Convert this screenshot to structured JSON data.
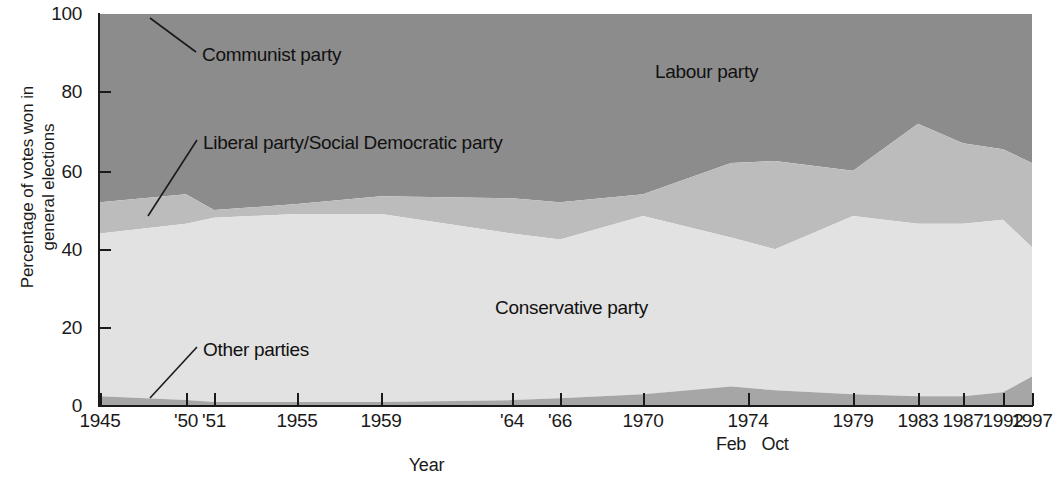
{
  "chart_data": {
    "type": "area",
    "stacked": true,
    "title": "",
    "xlabel": "Year",
    "ylabel": "Percentage of votes won in general elections",
    "ylim": [
      0,
      100
    ],
    "yticks": [
      0,
      20,
      40,
      60,
      80,
      100
    ],
    "grid": false,
    "legend_position": "in-plot-annotations",
    "categories": [
      "1945",
      "'50",
      "'51",
      "1955",
      "1959",
      "'64",
      "'66",
      "1970",
      "1974 Feb",
      "1974 Oct",
      "1979",
      "1983",
      "1987",
      "1992",
      "1997"
    ],
    "x_tick_labels": [
      "1945",
      "'50",
      "'51",
      "1955",
      "1959",
      "'64",
      "'66",
      "1970",
      "1974",
      "1979",
      "1983",
      "1987",
      "1992",
      "1997"
    ],
    "x_sub_tick_labels": [
      "Feb",
      "Oct"
    ],
    "series": [
      {
        "name": "Other parties",
        "color": "#a6a6a6",
        "values": [
          2.5,
          1.5,
          1.0,
          1.0,
          1.0,
          1.5,
          2.0,
          3.0,
          5.0,
          4.0,
          3.0,
          2.5,
          2.5,
          3.5,
          7.5
        ]
      },
      {
        "name": "Conservative party",
        "color": "#e2e2e2",
        "values": [
          41.5,
          45.0,
          47.0,
          48.0,
          48.0,
          42.5,
          40.5,
          45.5,
          38.0,
          36.0,
          45.5,
          44.0,
          44.0,
          44.0,
          33.0
        ]
      },
      {
        "name": "Liberal party/Social Democratic party",
        "color": "#bcbcbc",
        "values": [
          8.0,
          7.5,
          2.0,
          2.5,
          4.5,
          9.0,
          9.5,
          5.5,
          19.0,
          22.5,
          11.5,
          25.5,
          20.5,
          18.0,
          21.5
        ]
      },
      {
        "name": "Labour party",
        "color": "#8c8c8c",
        "values": [
          47.5,
          46.0,
          49.5,
          48.5,
          46.5,
          47.0,
          48.0,
          46.0,
          38.0,
          37.5,
          40.0,
          28.0,
          33.0,
          34.5,
          38.0
        ]
      },
      {
        "name": "Communist party",
        "color": "#8c8c8c",
        "values": [
          0.5,
          0.0,
          0.5,
          0.0,
          0.0,
          0.0,
          0.0,
          0.0,
          0.0,
          0.0,
          0.0,
          0.0,
          0.0,
          0.0,
          0.0
        ]
      }
    ],
    "stack_tops": {
      "other": [
        2.5,
        1.5,
        1.0,
        1.0,
        1.0,
        1.5,
        2.0,
        3.0,
        5.0,
        4.0,
        3.0,
        2.5,
        2.5,
        3.5,
        7.5
      ],
      "conservative": [
        44.0,
        46.5,
        48.0,
        49.0,
        49.0,
        44.0,
        42.5,
        48.5,
        43.0,
        40.0,
        48.5,
        46.5,
        46.5,
        47.5,
        40.5
      ],
      "liberal": [
        52.0,
        54.0,
        50.0,
        51.5,
        53.5,
        53.0,
        52.0,
        54.0,
        62.0,
        62.5,
        60.0,
        72.0,
        67.0,
        65.5,
        62.0
      ],
      "labour": [
        100,
        100,
        100,
        100,
        100,
        100,
        100,
        100,
        100,
        100,
        100,
        100,
        100,
        100,
        100
      ]
    },
    "annotations": [
      {
        "name": "Communist party",
        "text": "Communist party"
      },
      {
        "name": "Labour party",
        "text": "Labour party"
      },
      {
        "name": "Liberal party/Social Democratic party",
        "text": "Liberal party/Social Democratic party"
      },
      {
        "name": "Conservative party",
        "text": "Conservative party"
      },
      {
        "name": "Other parties",
        "text": "Other parties"
      }
    ]
  },
  "axes": {
    "y_title_line1": "Percentage of votes won in",
    "y_title_line2": "general elections",
    "x_title": "Year",
    "y_tick_0": "0",
    "y_tick_20": "20",
    "y_tick_40": "40",
    "y_tick_60": "60",
    "y_tick_80": "80",
    "y_tick_100": "100"
  },
  "xticks": [
    {
      "label": "1945",
      "x": 100
    },
    {
      "label": "'50",
      "x": 186
    },
    {
      "label": "'51",
      "x": 214
    },
    {
      "label": "1955",
      "x": 297
    },
    {
      "label": "1959",
      "x": 381
    },
    {
      "label": "'64",
      "x": 512
    },
    {
      "label": "'66",
      "x": 560
    },
    {
      "label": "1970",
      "x": 643
    },
    {
      "label": "1974",
      "x": 748
    },
    {
      "label": "1979",
      "x": 853
    },
    {
      "label": "1983",
      "x": 918
    },
    {
      "label": "1987",
      "x": 963
    },
    {
      "label": "1992",
      "x": 1003
    },
    {
      "label": "1997",
      "x": 1032
    }
  ],
  "subticks": [
    {
      "label": "Feb",
      "x": 731
    },
    {
      "label": "Oct",
      "x": 775
    }
  ],
  "labels": {
    "communist": "Communist party",
    "labour": "Labour party",
    "liberal_sdp": "Liberal party/Social Democratic party",
    "conservative": "Conservative party",
    "other": "Other parties"
  },
  "colors": {
    "labour": "#8c8c8c",
    "liberal": "#bcbcbc",
    "conservative": "#e2e2e2",
    "other": "#a6a6a6",
    "axis": "#1a1a1a",
    "background": "#ffffff"
  }
}
